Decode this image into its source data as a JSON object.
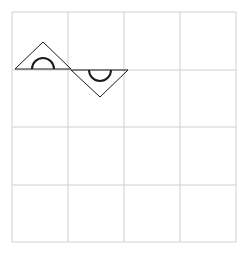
{
  "canvas": {
    "width": 248,
    "height": 254,
    "background": "#ffffff"
  },
  "grid": {
    "rows": 4,
    "cols": 4,
    "x_lines": [
      12,
      68,
      124,
      180,
      236
    ],
    "y_lines": [
      12,
      70,
      127,
      185,
      242
    ],
    "line_color": "#d0d0d0"
  },
  "shapes": [
    {
      "type": "triangle-with-semicircle",
      "orientation": "up",
      "points": [
        [
          15,
          69
        ],
        [
          71,
          69
        ],
        [
          43,
          42
        ]
      ],
      "arc_center": [
        43,
        69
      ],
      "arc_radius": 11
    },
    {
      "type": "triangle-with-semicircle",
      "orientation": "down",
      "points": [
        [
          71,
          70
        ],
        [
          128,
          70
        ],
        [
          100,
          97
        ]
      ],
      "arc_center": [
        100,
        70
      ],
      "arc_radius": 11
    }
  ],
  "stroke_color": "#1a1a1a"
}
